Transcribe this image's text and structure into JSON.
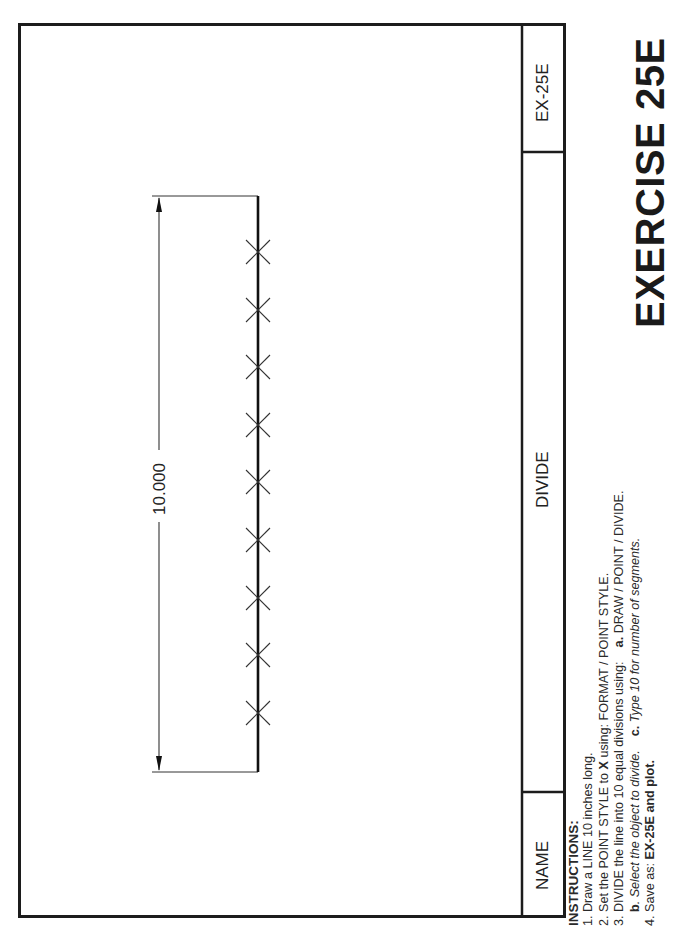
{
  "title_block": {
    "drawing_number": "EX-25E",
    "drawing_title": "DIVIDE",
    "name_label": "NAME"
  },
  "exercise_title": "EXERCISE 25E",
  "drawing": {
    "dimension_label": "10.000",
    "line_length_inches": 10,
    "divisions": 10,
    "point_style": "X",
    "point_count": 9
  },
  "instructions": {
    "heading": "INSTRUCTIONS:",
    "steps": [
      {
        "num": "1.",
        "text": "Draw a LINE 10 inches long."
      },
      {
        "num": "2.",
        "pre": "Set the POINT STYLE to ",
        "bold": "X",
        "post": " using: FORMAT / POINT STYLE."
      },
      {
        "num": "3.",
        "text": "DIVIDE the line into 10 equal divisions using:",
        "a_label": "a.",
        "a_text": " DRAW / POINT / DIVIDE."
      },
      {
        "num": "",
        "b_label": "b",
        "b_text": ". Select the object to divide.",
        "c_label": "c.",
        "c_text": " Type 10 for number of segments."
      },
      {
        "num": "4.",
        "pre": "Save as:  ",
        "bold": "EX-25E and plot."
      }
    ]
  }
}
